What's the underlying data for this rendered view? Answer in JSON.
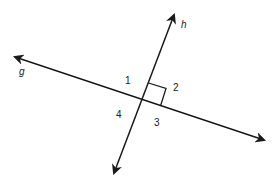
{
  "diagram": {
    "lines": [
      {
        "name": "g",
        "label": "g"
      },
      {
        "name": "h",
        "label": "h"
      }
    ],
    "angles": [
      {
        "id": "angle-1",
        "label": "1"
      },
      {
        "id": "angle-2",
        "label": "2"
      },
      {
        "id": "angle-3",
        "label": "3"
      },
      {
        "id": "angle-4",
        "label": "4"
      }
    ],
    "right_angle_marker": "angle-2"
  }
}
